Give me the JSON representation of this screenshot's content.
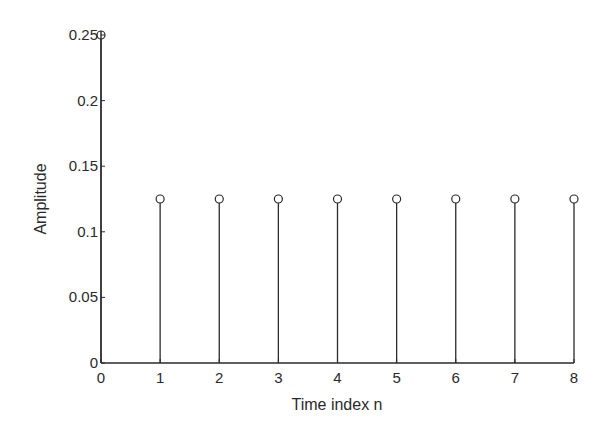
{
  "chart_data": {
    "type": "stem",
    "title": "",
    "xlabel": "Time index n",
    "ylabel": "Amplitude",
    "x": [
      0,
      1,
      2,
      3,
      4,
      5,
      6,
      7,
      8
    ],
    "values": [
      0.25,
      0.125,
      0.125,
      0.125,
      0.125,
      0.125,
      0.125,
      0.125,
      0.125
    ],
    "xlim": [
      0,
      8
    ],
    "ylim": [
      0,
      0.25
    ],
    "xticks": [
      "0",
      "1",
      "2",
      "3",
      "4",
      "5",
      "6",
      "7",
      "8"
    ],
    "yticks": [
      "0",
      "0.05",
      "0.1",
      "0.15",
      "0.2",
      "0.25"
    ],
    "grid": false,
    "marker": "circle-open",
    "color": "#2a2a2a"
  }
}
